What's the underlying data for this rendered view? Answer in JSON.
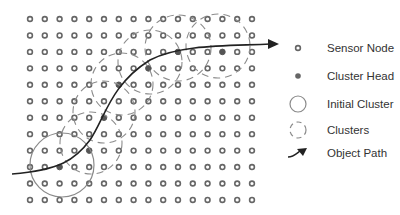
{
  "grid": {
    "columns": 16,
    "rows": 12,
    "x0": 30,
    "y0": 19,
    "dx": 14.8,
    "dy": 16.45,
    "node_radius": 2.4,
    "node_stroke": "#666666"
  },
  "cluster_heads": [
    {
      "col": 2,
      "row": 9
    },
    {
      "col": 4,
      "row": 8
    },
    {
      "col": 5,
      "row": 6
    },
    {
      "col": 6,
      "row": 4
    },
    {
      "col": 8,
      "row": 3
    },
    {
      "col": 10,
      "row": 2
    },
    {
      "col": 13,
      "row": 2
    }
  ],
  "initial_cluster": {
    "cx": 62,
    "cy": 165,
    "r": 32,
    "color": "#8a8a8a"
  },
  "clusters": [
    {
      "cx": 91,
      "cy": 143,
      "r": 31
    },
    {
      "cx": 104,
      "cy": 112,
      "r": 31
    },
    {
      "cx": 122,
      "cy": 84,
      "r": 31
    },
    {
      "cx": 150,
      "cy": 62,
      "r": 32
    },
    {
      "cx": 178,
      "cy": 48,
      "r": 33
    },
    {
      "cx": 218,
      "cy": 46,
      "r": 32
    }
  ],
  "object_path": {
    "d": "M12,174 C60,170 75,160 90,140 C105,118 110,85 150,60 C180,44 230,46 270,44",
    "arrow_tip": {
      "x": 279,
      "y": 44
    },
    "color": "#222222"
  },
  "legend": {
    "items": [
      {
        "icon": "sensor-node-icon",
        "label": "Sensor Node",
        "y": 48
      },
      {
        "icon": "cluster-head-icon",
        "label": "Cluster Head",
        "y": 76
      },
      {
        "icon": "initial-cluster-icon",
        "label": "Initial Cluster",
        "y": 104
      },
      {
        "icon": "clusters-icon",
        "label": "Clusters",
        "y": 130
      },
      {
        "icon": "object-path-icon",
        "label": "Object Path",
        "y": 153
      }
    ],
    "icon_x": 298,
    "label_x": 327
  }
}
